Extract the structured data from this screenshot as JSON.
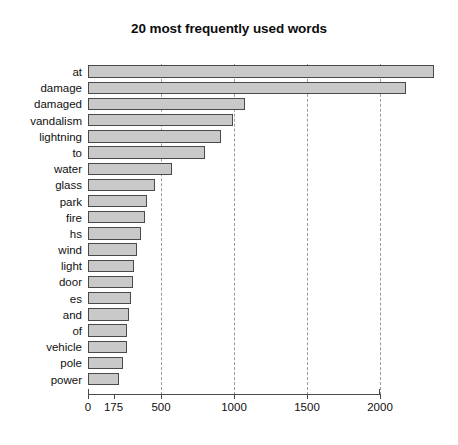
{
  "chart_data": {
    "type": "bar",
    "orientation": "horizontal",
    "title": "20 most frequently used words",
    "xlabel": "",
    "ylabel": "",
    "xlim": [
      0,
      2000
    ],
    "grid": true,
    "gridlines": [
      500,
      1000,
      1500,
      2000
    ],
    "legend": null,
    "xticks": [
      {
        "value": 0,
        "label": "0"
      },
      {
        "value": 175,
        "label": "175"
      },
      {
        "value": 500,
        "label": "500"
      },
      {
        "value": 1000,
        "label": "1000"
      },
      {
        "value": 1500,
        "label": "1500"
      },
      {
        "value": 2000,
        "label": "2000"
      }
    ],
    "categories": [
      "at",
      "damage",
      "damaged",
      "vandalism",
      "lightning",
      "to",
      "water",
      "glass",
      "park",
      "fire",
      "hs",
      "wind",
      "light",
      "door",
      "es",
      "and",
      "of",
      "vehicle",
      "pole",
      "power"
    ],
    "values": [
      2370,
      2175,
      1075,
      995,
      910,
      800,
      575,
      460,
      405,
      390,
      360,
      335,
      315,
      305,
      295,
      280,
      270,
      265,
      240,
      215
    ],
    "bar_fill_color": "#c9c9c9",
    "bar_edge_color": "#4a4a4a"
  }
}
